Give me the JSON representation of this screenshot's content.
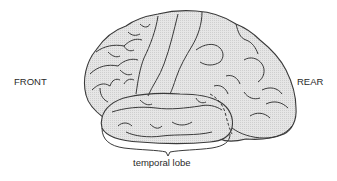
{
  "diagram": {
    "labels": {
      "front": "FRONT",
      "rear": "REAR",
      "temporal_lobe": "temporal lobe"
    },
    "colors": {
      "brain_fill": "#e4e4e4",
      "outline": "#3a3a3a",
      "text": "#2a2a2a",
      "background": "#ffffff"
    }
  }
}
